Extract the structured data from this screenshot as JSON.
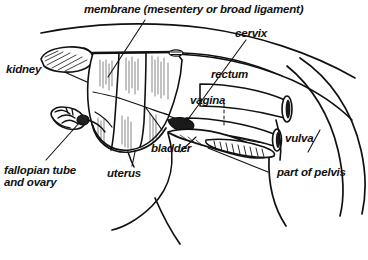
{
  "figure": {
    "type": "anatomical-diagram",
    "background_color": "#ffffff",
    "ink_color": "#111111"
  },
  "title": {
    "text": "membrane (mesentery or broad ligament)"
  },
  "labels": [
    {
      "id": "membrane",
      "text": "membrane (mesentery or broad ligament)"
    },
    {
      "id": "cervix",
      "text": "cervix"
    },
    {
      "id": "kidney",
      "text": "kidney"
    },
    {
      "id": "rectum",
      "text": "rectum"
    },
    {
      "id": "vagina",
      "text": "vagina"
    },
    {
      "id": "vulva",
      "text": "vulva"
    },
    {
      "id": "bladder",
      "text": "bladder"
    },
    {
      "id": "uterus",
      "text": "uterus"
    },
    {
      "id": "fallopian",
      "text": "fallopian tube\nand ovary"
    },
    {
      "id": "pelvis",
      "text": "part of pelvis"
    }
  ]
}
